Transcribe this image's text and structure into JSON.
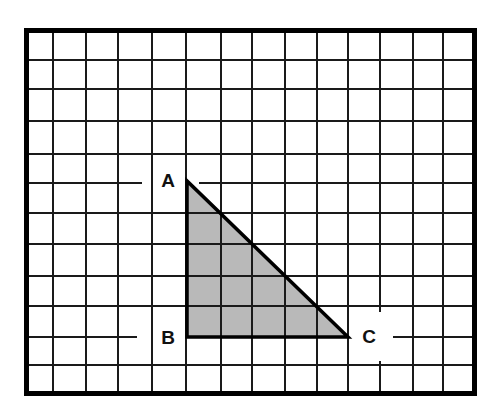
{
  "diagram": {
    "type": "grid-triangle",
    "canvas": {
      "width": 486,
      "height": 401
    },
    "frame": {
      "x1": 24,
      "y1": 28,
      "x2": 477,
      "y2": 396,
      "stroke_width": 5,
      "color": "#000000"
    },
    "grid": {
      "columns": 14,
      "rows": 12,
      "vertical_lines_x": [
        53,
        86,
        118,
        152,
        186,
        221,
        252,
        285,
        317,
        348,
        380,
        413,
        443
      ],
      "horizontal_lines_y": [
        60,
        89,
        121,
        154,
        183,
        213,
        244,
        276,
        306,
        337,
        365
      ],
      "line_color": "#1a1a1a",
      "gaps": [
        {
          "orientation": "horizontal",
          "y": 183,
          "from": 142,
          "to": 199
        },
        {
          "orientation": "horizontal",
          "y": 337,
          "from": 137,
          "to": 186
        },
        {
          "orientation": "horizontal",
          "y": 337,
          "from": 348,
          "to": 393
        },
        {
          "orientation": "vertical",
          "x": 380,
          "from": 312,
          "to": 361
        }
      ]
    },
    "triangle": {
      "fill": "#b9b9b9",
      "edge_color": "#000000",
      "vertices": [
        {
          "name": "A",
          "x": 187,
          "y": 181,
          "label_x": 168,
          "label_y": 180
        },
        {
          "name": "B",
          "x": 187,
          "y": 337,
          "label_x": 168,
          "label_y": 337
        },
        {
          "name": "C",
          "x": 348,
          "y": 337,
          "label_x": 369,
          "label_y": 336
        }
      ]
    },
    "labels": {
      "A": "A",
      "B": "B",
      "C": "C"
    }
  }
}
